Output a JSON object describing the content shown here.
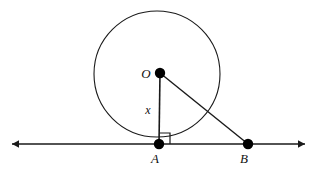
{
  "figure": {
    "type": "geometry-diagram",
    "background_color": "#ffffff",
    "stroke_color": "#1a1a1a",
    "point_fill_color": "#000000",
    "width": 316,
    "height": 175
  },
  "labels": {
    "center": "O",
    "tangent_point": "A",
    "external_point": "B",
    "radius_segment": "x"
  },
  "points": [
    {
      "name": "O",
      "label": "O",
      "x": 160,
      "y": 73,
      "radius": 5.2,
      "label_x": 146,
      "label_y": 78
    },
    {
      "name": "A",
      "label": "A",
      "x": 159,
      "y": 144,
      "radius": 5.2,
      "label_x": 155,
      "label_y": 163
    },
    {
      "name": "B",
      "label": "B",
      "x": 248,
      "y": 144,
      "radius": 5.2,
      "label_x": 244,
      "label_y": 163
    }
  ],
  "circle": {
    "center_x": 157,
    "center_y": 74,
    "radius": 63,
    "stroke_width": 1.1
  },
  "segments": [
    {
      "name": "radius-OA",
      "x1": 160,
      "y1": 73,
      "x2": 159,
      "y2": 144,
      "stroke_width": 1.6,
      "label": "x",
      "label_x": 148,
      "label_y": 114
    },
    {
      "name": "hypotenuse-OB",
      "x1": 160,
      "y1": 73,
      "x2": 248,
      "y2": 144,
      "stroke_width": 1.4
    }
  ],
  "line": {
    "name": "tangent-line",
    "y": 144,
    "x_start": 12,
    "x_end": 305,
    "stroke_width": 1.4,
    "arrow_left": true,
    "arrow_right": true,
    "arrow_size": 7
  },
  "right_angle": {
    "name": "right-angle-marker",
    "vertex_x": 159,
    "vertex_y": 144,
    "size": 11,
    "direction": "up-right",
    "stroke_width": 1.2
  }
}
